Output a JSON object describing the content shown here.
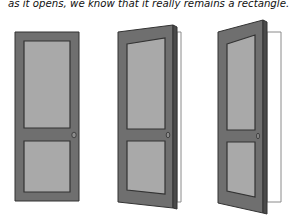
{
  "caption": {
    "text": "as it opens, we know that it really remains a rectangle."
  },
  "colors": {
    "door_face": "#6f6f6f",
    "door_edge": "#4a4a4a",
    "panel": "#a9a9a9",
    "outline": "#333333",
    "frame_opening": "#ffffff",
    "frame_outline": "#8a8a8a",
    "knob": "#8c8c8c"
  },
  "doors": [
    {
      "name": "closed",
      "face": "15,32 79,32 79,201 15,201",
      "edge": "",
      "opening": "",
      "panel_top": "24,41 70,41 70,128 24,128",
      "panel_bottom": "24,141 70,141 70,192 24,192",
      "knob": {
        "cx": 74,
        "cy": 135,
        "rx": 2.2,
        "ry": 2.8
      }
    },
    {
      "name": "partly-open",
      "face": "118,32 173,25 173,208 118,202",
      "edge": "173,25 177,27 177,209 173,208",
      "opening": "177,32 181,32 181,202 177,202",
      "panel_top": "127,44 165,38 165,129 127,129",
      "panel_bottom": "127,141 165,141 165,194 127,190",
      "knob": {
        "cx": 168,
        "cy": 135,
        "rx": 1.8,
        "ry": 2.8
      }
    },
    {
      "name": "more-open",
      "face": "218,32 263,20 263,213 218,203",
      "edge": "263,20 267,22 267,214 263,213",
      "opening": "267,32 281,32 281,202 267,202",
      "panel_top": "227,44 255,35 255,130 227,130",
      "panel_bottom": "227,142 255,142 255,197 227,191",
      "knob": {
        "cx": 258,
        "cy": 136,
        "rx": 1.5,
        "ry": 2.8
      }
    }
  ]
}
